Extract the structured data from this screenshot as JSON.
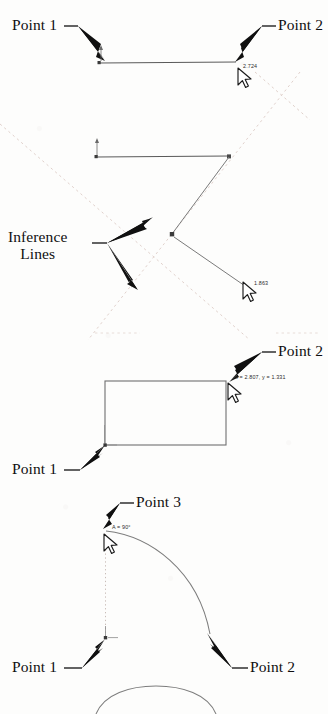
{
  "figure": {
    "background_color": "#fdfdfc",
    "geometry_color": "#4a4a4a",
    "inference_color": "#d8c9c4",
    "annotation_color": "#101010",
    "cursor_outline": "#1a1a1a"
  },
  "panels": [
    {
      "id": "panel-line",
      "callouts": [
        {
          "name": "point-1",
          "label": "Point 1"
        },
        {
          "name": "point-2",
          "label": "Point 2"
        }
      ],
      "readouts": [
        {
          "name": "length-readout",
          "value": "2.724"
        }
      ],
      "cursors": [
        {
          "name": "mouse-cursor"
        }
      ]
    },
    {
      "id": "panel-inference",
      "callouts": [
        {
          "name": "inference-lines",
          "label_line_1": "Inference",
          "label_line_2": "Lines"
        }
      ],
      "readouts": [
        {
          "name": "length-readout",
          "value": "1.863"
        }
      ],
      "cursors": [
        {
          "name": "mouse-cursor"
        }
      ]
    },
    {
      "id": "panel-rectangle",
      "callouts": [
        {
          "name": "point-1",
          "label": "Point 1"
        },
        {
          "name": "point-2",
          "label": "Point 2"
        }
      ],
      "readouts": [
        {
          "name": "coordinate-readout",
          "value": "x = 2.807, y = 1.331"
        }
      ],
      "cursors": [
        {
          "name": "mouse-cursor"
        }
      ]
    },
    {
      "id": "panel-arc",
      "callouts": [
        {
          "name": "point-1",
          "label": "Point 1"
        },
        {
          "name": "point-2",
          "label": "Point 2"
        },
        {
          "name": "point-3",
          "label": "Point 3"
        }
      ],
      "readouts": [
        {
          "name": "angle-readout",
          "value": "A = 90°"
        }
      ],
      "cursors": [
        {
          "name": "mouse-cursor"
        }
      ]
    }
  ],
  "labels": {
    "p1_a": "Point 1",
    "p2_a": "Point 2",
    "inference_1": "Inference",
    "inference_2": "Lines",
    "p1_c": "Point 1",
    "p2_c": "Point 2",
    "p1_d": "Point 1",
    "p2_d": "Point 2",
    "p3_d": "Point 3",
    "dim_a": "2.724",
    "dim_b": "1.863",
    "dim_c": "x = 2.807, y = 1.331",
    "dim_d": "A = 90°"
  }
}
